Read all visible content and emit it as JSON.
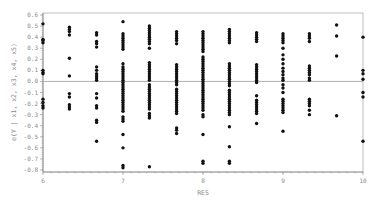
{
  "chart_data": {
    "type": "scatter",
    "title": "",
    "xlabel": "RES",
    "ylabel": "e(Y | x1, x2, x3, x4, x5)",
    "xlim": [
      6,
      10
    ],
    "ylim": [
      -0.8,
      0.6
    ],
    "x_ticks": [
      "6",
      "7",
      "8",
      "9",
      "10"
    ],
    "y_ticks": [
      "0.6",
      "0.5",
      "0.4",
      "0.3",
      "0.2",
      "0.1",
      "0.0",
      "-0.1",
      "-0.2",
      "-0.3",
      "-0.4",
      "-0.5",
      "-0.6",
      "-0.7",
      "-0.8"
    ],
    "reference_line_y": 0.0,
    "grid": false,
    "legend": null,
    "series": [
      {
        "name": "residuals",
        "points_by_x": [
          {
            "x": 6.0,
            "y": [
              0.52,
              0.38,
              0.37,
              0.35,
              0.1,
              0.08,
              0.07,
              -0.16,
              -0.19,
              -0.22,
              -0.24
            ]
          },
          {
            "x": 6.33,
            "y": [
              0.49,
              0.47,
              0.45,
              0.42,
              0.21,
              0.05,
              -0.11,
              -0.14,
              -0.21,
              -0.23,
              -0.25
            ]
          },
          {
            "x": 6.67,
            "y": [
              0.44,
              0.42,
              0.36,
              0.34,
              0.31,
              0.13,
              0.1,
              0.07,
              0.05,
              0.03,
              0.01,
              -0.11,
              -0.15,
              -0.22,
              -0.24,
              -0.35,
              -0.37,
              -0.54
            ]
          },
          {
            "x": 7.0,
            "y": [
              0.54,
              0.43,
              0.41,
              0.39,
              0.37,
              0.35,
              0.33,
              0.31,
              0.29,
              0.16,
              0.13,
              0.11,
              0.09,
              0.07,
              0.05,
              0.03,
              0.01,
              -0.01,
              -0.03,
              -0.05,
              -0.07,
              -0.09,
              -0.11,
              -0.13,
              -0.15,
              -0.17,
              -0.19,
              -0.21,
              -0.23,
              -0.25,
              -0.27,
              -0.32,
              -0.34,
              -0.36,
              -0.48,
              -0.6,
              -0.76,
              -0.78
            ]
          },
          {
            "x": 7.33,
            "y": [
              0.5,
              0.48,
              0.46,
              0.44,
              0.42,
              0.4,
              0.38,
              0.36,
              0.34,
              0.3,
              0.17,
              0.15,
              0.13,
              0.11,
              0.09,
              0.07,
              0.05,
              0.03,
              0.01,
              -0.03,
              -0.05,
              -0.07,
              -0.09,
              -0.11,
              -0.13,
              -0.15,
              -0.17,
              -0.19,
              -0.21,
              -0.23,
              -0.25,
              -0.29,
              -0.31,
              -0.33,
              -0.77
            ]
          },
          {
            "x": 7.67,
            "y": [
              0.45,
              0.43,
              0.41,
              0.39,
              0.37,
              0.34,
              0.15,
              0.13,
              0.11,
              0.09,
              0.07,
              0.05,
              0.03,
              0.01,
              -0.01,
              -0.03,
              -0.07,
              -0.09,
              -0.11,
              -0.13,
              -0.15,
              -0.17,
              -0.19,
              -0.21,
              -0.23,
              -0.25,
              -0.27,
              -0.29,
              -0.42,
              -0.44,
              -0.47
            ]
          },
          {
            "x": 8.0,
            "y": [
              0.45,
              0.43,
              0.41,
              0.39,
              0.37,
              0.35,
              0.33,
              0.31,
              0.29,
              0.27,
              0.22,
              0.2,
              0.18,
              0.16,
              0.14,
              0.12,
              0.1,
              0.08,
              0.06,
              0.04,
              0.02,
              0.0,
              -0.02,
              -0.04,
              -0.06,
              -0.08,
              -0.1,
              -0.12,
              -0.14,
              -0.16,
              -0.18,
              -0.2,
              -0.22,
              -0.24,
              -0.26,
              -0.3,
              -0.32,
              -0.48,
              -0.72,
              -0.74
            ]
          },
          {
            "x": 8.33,
            "y": [
              0.47,
              0.45,
              0.43,
              0.41,
              0.39,
              0.37,
              0.35,
              0.16,
              0.14,
              0.12,
              0.1,
              0.08,
              0.06,
              0.04,
              0.02,
              0.0,
              -0.02,
              -0.04,
              -0.08,
              -0.1,
              -0.12,
              -0.14,
              -0.16,
              -0.18,
              -0.2,
              -0.22,
              -0.24,
              -0.26,
              -0.28,
              -0.3,
              -0.41,
              -0.59,
              -0.72,
              -0.74
            ]
          },
          {
            "x": 8.67,
            "y": [
              0.44,
              0.42,
              0.4,
              0.38,
              0.36,
              0.15,
              0.13,
              0.11,
              0.09,
              0.07,
              0.05,
              0.03,
              0.01,
              -0.01,
              -0.13,
              -0.17,
              -0.19,
              -0.21,
              -0.23,
              -0.25,
              -0.27,
              -0.29,
              -0.38
            ]
          },
          {
            "x": 9.0,
            "y": [
              0.43,
              0.41,
              0.39,
              0.37,
              0.35,
              0.3,
              0.24,
              0.2,
              0.16,
              0.12,
              0.09,
              0.06,
              0.03,
              0.01,
              -0.03,
              -0.06,
              -0.1,
              -0.16,
              -0.18,
              -0.2,
              -0.22,
              -0.24,
              -0.26,
              -0.28,
              -0.45
            ]
          },
          {
            "x": 9.33,
            "y": [
              0.43,
              0.41,
              0.39,
              0.36,
              0.14,
              0.12,
              0.1,
              0.08,
              0.06,
              0.03,
              0.01,
              -0.16,
              -0.18,
              -0.2,
              -0.22,
              -0.26,
              -0.3
            ]
          },
          {
            "x": 9.67,
            "y": [
              0.51,
              0.41,
              0.23,
              -0.31
            ]
          },
          {
            "x": 10.0,
            "y": [
              0.4,
              0.1,
              0.07,
              0.02,
              -0.1,
              -0.14,
              -0.54
            ]
          }
        ]
      }
    ],
    "marker": {
      "shape": "circle",
      "color": "#111111",
      "radius": 1.7
    },
    "colors": {
      "axis": "#8a8a8a",
      "frame": "#b0b0b0",
      "reference_line": "#9a9a9a",
      "points": "#111111"
    }
  }
}
